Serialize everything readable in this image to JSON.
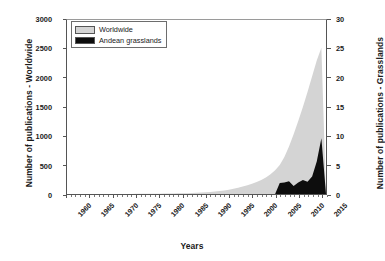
{
  "chart_data": {
    "type": "area",
    "title": "",
    "xlabel": "Years",
    "ylabel": "Number of publications - Worldwide",
    "ylabel_secondary": "Number of publications - Grasslands",
    "grid": false,
    "legend_position": "top-left",
    "xlim": [
      1960,
      2016
    ],
    "ylim": [
      0,
      3000
    ],
    "ylim_secondary": [
      0,
      30
    ],
    "xticks": [
      "1960",
      "1965",
      "1970",
      "1975",
      "1980",
      "1985",
      "1990",
      "1995",
      "2000",
      "2005",
      "2010",
      "2015"
    ],
    "xtick_values": [
      1960,
      1965,
      1970,
      1975,
      1980,
      1985,
      1990,
      1995,
      2000,
      2005,
      2010,
      2015
    ],
    "yticks_left": [
      "0",
      "500",
      "1000",
      "1500",
      "2000",
      "2500",
      "3000"
    ],
    "ytick_values_left": [
      0,
      500,
      1000,
      1500,
      2000,
      2500,
      3000
    ],
    "yticks_right": [
      "0",
      "5",
      "10",
      "15",
      "20",
      "25",
      "30"
    ],
    "ytick_values_right": [
      0,
      5,
      10,
      15,
      20,
      25,
      30
    ],
    "x": [
      1960,
      1961,
      1962,
      1963,
      1964,
      1965,
      1966,
      1967,
      1968,
      1969,
      1970,
      1971,
      1972,
      1973,
      1974,
      1975,
      1976,
      1977,
      1978,
      1979,
      1980,
      1981,
      1982,
      1983,
      1984,
      1985,
      1986,
      1987,
      1988,
      1989,
      1990,
      1991,
      1992,
      1993,
      1994,
      1995,
      1996,
      1997,
      1998,
      1999,
      2000,
      2001,
      2002,
      2003,
      2004,
      2005,
      2006,
      2007,
      2008,
      2009,
      2010,
      2011,
      2012,
      2013,
      2014,
      2015,
      2016
    ],
    "series": [
      {
        "name": "Worldwide",
        "axis": "left",
        "color": "#d4d4d4",
        "values": [
          0,
          0,
          0,
          0,
          0,
          0,
          0,
          0,
          0,
          0,
          1,
          1,
          1,
          2,
          2,
          3,
          3,
          4,
          4,
          5,
          6,
          7,
          8,
          9,
          11,
          13,
          15,
          18,
          21,
          25,
          30,
          36,
          43,
          52,
          62,
          75,
          90,
          108,
          128,
          150,
          175,
          205,
          240,
          285,
          340,
          410,
          500,
          640,
          820,
          1030,
          1260,
          1500,
          1760,
          2030,
          2300,
          2520,
          0
        ]
      },
      {
        "name": "Andean grasslands",
        "axis": "right",
        "color": "#0d0d0d",
        "values": [
          0,
          0,
          0,
          0,
          0,
          0,
          0,
          0,
          0,
          0,
          0,
          0,
          0,
          0,
          0,
          0,
          0,
          0,
          0,
          0,
          0,
          0,
          0,
          0,
          0,
          0,
          0,
          0,
          0,
          0,
          0,
          0,
          0,
          0,
          0,
          0,
          0,
          0,
          0,
          0,
          0,
          0,
          0,
          0,
          0,
          0,
          1.9,
          2.0,
          2.2,
          1.4,
          2.0,
          2.4,
          2.1,
          3.0,
          5.6,
          9.6,
          0
        ]
      }
    ]
  },
  "legend": {
    "items": [
      {
        "label": "Worldwide",
        "color": "#d4d4d4"
      },
      {
        "label": "Andean grasslands",
        "color": "#0d0d0d"
      }
    ]
  },
  "axes": {
    "left_title": "Number of publications - Worldwide",
    "right_title": "Number of publications - Grasslands",
    "bottom_title": "Years"
  }
}
